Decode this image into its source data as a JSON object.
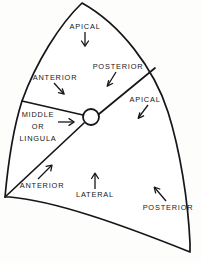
{
  "figure": {
    "type": "anatomical-diagram",
    "stroke_color": "#16161a",
    "fill_color": "#ffffff",
    "background_color": "#fdfdfb"
  },
  "hilum": {
    "name": "hilum-circle",
    "cx": 91,
    "cy": 117,
    "r": 8
  },
  "labels": {
    "apical_upper": "APICAL",
    "posterior_upper": "POSTERIOR",
    "anterior_upper": "ANTERIOR",
    "apical_right": "APICAL",
    "middle_line1": "MIDDLE",
    "middle_line2": "OR",
    "middle_line3": "LINGULA",
    "anterior_lower": "ANTERIOR",
    "lateral_lower": "LATERAL",
    "posterior_lower": "POSTERIOR"
  },
  "arrows": [
    {
      "name": "arrow-apical-upper",
      "direction": "down"
    },
    {
      "name": "arrow-posterior-upper",
      "direction": "down-left"
    },
    {
      "name": "arrow-anterior-upper",
      "direction": "down-right"
    },
    {
      "name": "arrow-apical-right",
      "direction": "down-left"
    },
    {
      "name": "arrow-middle-lingula",
      "direction": "right"
    },
    {
      "name": "arrow-anterior-lower",
      "direction": "up-right"
    },
    {
      "name": "arrow-lateral-lower",
      "direction": "up"
    },
    {
      "name": "arrow-posterior-lower",
      "direction": "up-left"
    }
  ]
}
